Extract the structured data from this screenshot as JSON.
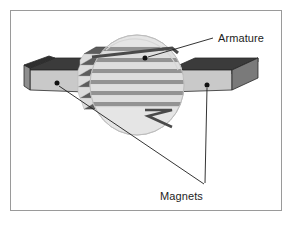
{
  "figure": {
    "kind": "technical-diagram",
    "background_color": "#ffffff",
    "border_color": "#9a9a9a"
  },
  "labels": {
    "armature": "Armature",
    "magnets": "Magnets"
  },
  "annotations": [
    {
      "name": "armature-callout",
      "label": "Armature",
      "dot": [
        145,
        58
      ],
      "text_anchor": [
        216,
        38
      ],
      "leader": [
        [
          152,
          57
        ],
        [
          213,
          38
        ]
      ]
    },
    {
      "name": "magnets-callout",
      "label": "Magnets",
      "dots": [
        [
          57,
          83
        ],
        [
          207,
          85
        ]
      ],
      "text_anchor": [
        160,
        190
      ],
      "leaders": [
        [
          [
            59,
            85
          ],
          [
            204,
            184
          ]
        ],
        [
          [
            207,
            88
          ],
          [
            205,
            183
          ]
        ]
      ]
    }
  ],
  "parts": {
    "armature": {
      "name": "armature",
      "shape": "translucent cylinder with stacked windings",
      "body_fill": "#e9e9e9",
      "body_stroke": "#c2c2c2",
      "winding_dark": "#5c5c5c",
      "winding_light": "#dcdcdc",
      "winding_band_count": 7,
      "lead_wire_color": "#4a4a4a",
      "center": [
        137,
        85
      ],
      "radius_x": 47,
      "radius_y": 50
    },
    "magnet_left": {
      "name": "magnet-left",
      "top_face_fill": "#3b3b3b",
      "front_face_fill": "#c9c9c9",
      "side_face_fill": "#8e8e8e",
      "outline": "#2a2a2a"
    },
    "magnet_right": {
      "name": "magnet-right",
      "top_face_fill": "#3b3b3b",
      "front_face_fill": "#c9c9c9",
      "side_face_fill": "#8e8e8e",
      "outline": "#2a2a2a"
    }
  },
  "colors": {
    "ink": "#1d1d1d",
    "leader_line": "#1d1d1d",
    "magnet_dark": "#3b3b3b",
    "magnet_light": "#c9c9c9",
    "winding_dark": "#5c5c5c",
    "cylinder_glass": "#e9e9e9"
  }
}
